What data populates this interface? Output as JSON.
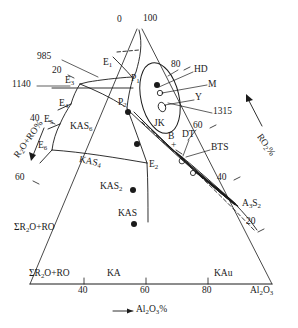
{
  "figure": {
    "type": "ternary-phase-diagram",
    "title": "",
    "background": "#ffffff",
    "line_color": "#1a1a1a"
  },
  "axes": {
    "bottom": {
      "label_text": "Al2O3%",
      "label_html": "—▶ Al₂O₃%",
      "arrow_label": "Al₂O₃%",
      "ticks": [
        "40",
        "60",
        "80"
      ],
      "left_end_label": "ΣR₂O+RO",
      "right_end_label": "Al₂O₃",
      "segment_labels": [
        "KA",
        "KAu"
      ]
    },
    "left": {
      "label_html": "R₂O+RO%",
      "label_text": "R2O+RO%",
      "ticks": [
        "20",
        "40",
        "60"
      ],
      "base_label": "ΣR₂O+RO"
    },
    "right": {
      "label_html": "RO₂%",
      "label_text": "RO2%",
      "ticks": [
        "80",
        "60",
        "40",
        "20"
      ]
    },
    "apex": {
      "left_label": "0",
      "right_label": "100"
    }
  },
  "temperatures": [
    {
      "value": "985",
      "x": 37,
      "y": 57
    },
    {
      "value": "1140",
      "x": 14,
      "y": 83
    },
    {
      "value": "1315",
      "x": 214,
      "y": 110
    }
  ],
  "invariant_points": [
    {
      "name": "E1",
      "html": "E<span class='sub'>1</span>",
      "x": 104,
      "y": 63
    },
    {
      "name": "P1",
      "html": "P<span class='sub'>1</span>",
      "x": 134,
      "y": 79
    },
    {
      "name": "E3",
      "html": "E<span class='sub'>3</span>",
      "x": 74,
      "y": 81
    },
    {
      "name": "E4",
      "html": "E<span class='sub'>4</span>",
      "x": 67,
      "y": 103
    },
    {
      "name": "E5",
      "html": "E<span class='sub'>5</span>",
      "x": 50,
      "y": 119
    },
    {
      "name": "E6",
      "html": "E<span class='sub'>6</span>",
      "x": 43,
      "y": 145
    },
    {
      "name": "P2",
      "html": "P<span class='sub'>2</span>",
      "x": 121,
      "y": 102
    },
    {
      "name": "E2",
      "html": "E<span class='sub'>2</span>",
      "x": 150,
      "y": 164
    }
  ],
  "phases": [
    {
      "name": "KAS6",
      "html": "KAS<span class='sub'>6</span>",
      "x": 76,
      "y": 127
    },
    {
      "name": "KAS4",
      "html": "KAS<span class='sub'>4</span>",
      "x": 88,
      "y": 149
    },
    {
      "name": "KAS2",
      "html": "KAS<span class='sub'>2</span>",
      "x": 105,
      "y": 186
    },
    {
      "name": "KAS",
      "html": "KAS",
      "x": 120,
      "y": 214
    },
    {
      "name": "A3S2",
      "html": "A<span class='sub'>3</span>S<span class='sub'>2</span>",
      "x": 245,
      "y": 203
    }
  ],
  "compound_dots": [
    {
      "name": "KAS6-dot",
      "x": 128,
      "y": 112,
      "r": 3.1
    },
    {
      "name": "KAS4-dot",
      "x": 137,
      "y": 144,
      "r": 3.1
    },
    {
      "name": "KAS2-dot",
      "x": 133,
      "y": 190,
      "r": 3.1
    },
    {
      "name": "KAS-dot",
      "x": 134,
      "y": 224,
      "r": 3.1
    },
    {
      "name": "HD-dot",
      "x": 157,
      "y": 85,
      "r": 3.2
    }
  ],
  "annotations": [
    {
      "name": "HD",
      "label": "HD",
      "x": 195,
      "y": 70,
      "leader_to_x": 160,
      "leader_to_y": 88
    },
    {
      "name": "M",
      "label": "M",
      "x": 209,
      "y": 85,
      "leader_to_x": 165,
      "leader_to_y": 92
    },
    {
      "name": "Y",
      "label": "Y",
      "x": 196,
      "y": 98,
      "leader_to_x": 164,
      "leader_to_y": 103
    },
    {
      "name": "JK",
      "label": "JK",
      "x": 156,
      "y": 124,
      "leader_to_x": 148,
      "leader_to_y": 142
    },
    {
      "name": "B",
      "label": "B",
      "x": 170,
      "y": 137,
      "leader_to_x": 166,
      "leader_to_y": 150
    },
    {
      "name": "DT",
      "label": "DT",
      "x": 184,
      "y": 135,
      "leader_to_x": 178,
      "leader_to_y": 152
    },
    {
      "name": "BTS",
      "label": "BTS",
      "x": 212,
      "y": 148,
      "leader_to_x": 186,
      "leader_to_y": 156
    }
  ],
  "scale_labels": [
    {
      "name": "tick-left-20",
      "text": "20",
      "x": 54,
      "y": 70
    },
    {
      "name": "tick-left-40",
      "text": "40",
      "x": 32,
      "y": 118
    },
    {
      "name": "tick-left-60",
      "text": "60",
      "x": 17,
      "y": 177
    },
    {
      "name": "tick-right-80",
      "text": "80",
      "x": 172,
      "y": 64
    },
    {
      "name": "tick-right-60",
      "text": "60",
      "x": 194,
      "y": 125
    },
    {
      "name": "tick-right-40",
      "text": "40",
      "x": 218,
      "y": 177
    },
    {
      "name": "tick-right-20",
      "text": "20",
      "x": 247,
      "y": 221
    }
  ],
  "plus_marker": {
    "symbol": "+",
    "x": 173,
    "y": 146
  },
  "small_markers": [
    {
      "name": "open-circle-M",
      "x": 160,
      "y": 92,
      "rx": 2.6,
      "ry": 2.6
    },
    {
      "name": "open-ellipse-Y",
      "x": 162,
      "y": 106,
      "rx": 3.4,
      "ry": 4.6,
      "rot": -20
    },
    {
      "name": "open-circle-low",
      "x": 182,
      "y": 160,
      "rx": 2.8,
      "ry": 2.8
    },
    {
      "name": "open-circle-low2",
      "x": 193,
      "y": 172,
      "rx": 2.6,
      "ry": 2.6
    }
  ]
}
